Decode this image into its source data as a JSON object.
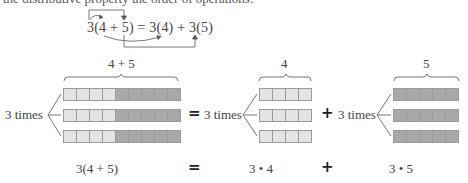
{
  "top_text": "the distributive property the order of operations.",
  "formula": "3(4 + 5) = 3(4) + 3(5)",
  "groups": [
    {
      "brace_label": "4 + 5",
      "times_label": "3 times",
      "rows": 3,
      "light_cells": 4,
      "dark_cells": 5
    },
    {
      "brace_label": "4",
      "times_label": "3 times",
      "rows": 3,
      "light_cells": 4,
      "dark_cells": 0
    },
    {
      "brace_label": "5",
      "times_label": "3 times",
      "rows": 3,
      "light_cells": 0,
      "dark_cells": 5
    }
  ],
  "operators": {
    "equals": "=",
    "plus": "+"
  },
  "bottom": {
    "left": "3(4 + 5)",
    "equals": "=",
    "middle": "3 • 4",
    "plus": "+",
    "right": "3 • 5"
  },
  "colors": {
    "light_cell": "#e4e4e4",
    "dark_cell": "#a9a9a9",
    "cell_border": "#9a9a9a",
    "lines": "#666666"
  }
}
